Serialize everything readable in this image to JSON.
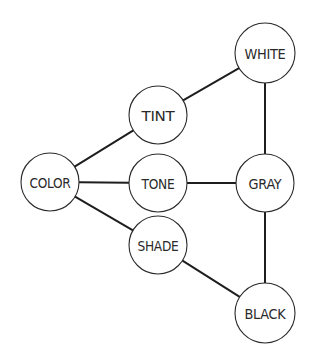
{
  "diagram": {
    "type": "node-link",
    "background": "#ffffff",
    "line_color": "#1e1e1e",
    "nodes": [
      {
        "id": "white",
        "label": "WHITE",
        "cx": 265,
        "cy": 53,
        "r": 30
      },
      {
        "id": "tint",
        "label": "TINT",
        "cx": 158,
        "cy": 115,
        "r": 29
      },
      {
        "id": "color",
        "label": "COLOR",
        "cx": 50,
        "cy": 182,
        "r": 29
      },
      {
        "id": "tone",
        "label": "TONE",
        "cx": 158,
        "cy": 183,
        "r": 29
      },
      {
        "id": "gray",
        "label": "GRAY",
        "cx": 265,
        "cy": 183,
        "r": 29
      },
      {
        "id": "shade",
        "label": "SHADE",
        "cx": 158,
        "cy": 245,
        "r": 29
      },
      {
        "id": "black",
        "label": "BLACK",
        "cx": 265,
        "cy": 313,
        "r": 30
      }
    ],
    "edges": [
      {
        "from": "color",
        "to": "tint"
      },
      {
        "from": "tint",
        "to": "white"
      },
      {
        "from": "color",
        "to": "tone"
      },
      {
        "from": "tone",
        "to": "gray"
      },
      {
        "from": "color",
        "to": "shade"
      },
      {
        "from": "shade",
        "to": "black"
      },
      {
        "from": "white",
        "to": "gray"
      },
      {
        "from": "gray",
        "to": "black"
      }
    ]
  }
}
